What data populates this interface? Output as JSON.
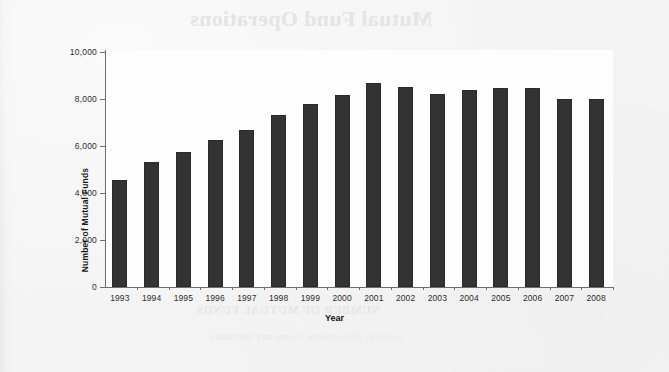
{
  "page": {
    "bleed_through_title": "Mutual Fund Operations",
    "bleed_through_subtitle": "NUMBER OF MUTUAL FUNDS",
    "bleed_through_caption": "Source: Investment Company Institute"
  },
  "chart_data": {
    "type": "bar",
    "title": "",
    "xlabel": "Year",
    "ylabel": "Number of Mutual Funds",
    "categories": [
      "1993",
      "1994",
      "1995",
      "1996",
      "1997",
      "1998",
      "1999",
      "2000",
      "2001",
      "2002",
      "2003",
      "2004",
      "2005",
      "2006",
      "2007",
      "2008"
    ],
    "values": [
      4534,
      5330,
      5725,
      6248,
      6684,
      7314,
      7791,
      8155,
      8700,
      8500,
      8200,
      8400,
      8450,
      8450,
      8000,
      8020
    ],
    "ylim": [
      0,
      10000
    ],
    "ytick_values": [
      0,
      2000,
      4000,
      6000,
      8000,
      10000
    ],
    "ytick_labels": [
      "0",
      "2,000",
      "4,000",
      "6,000",
      "8,000",
      "10,000"
    ],
    "grid": false,
    "legend": false,
    "bar_color": "#333333",
    "axis_color": "#6e6e6e",
    "plot_background": "#fdfdfd"
  }
}
